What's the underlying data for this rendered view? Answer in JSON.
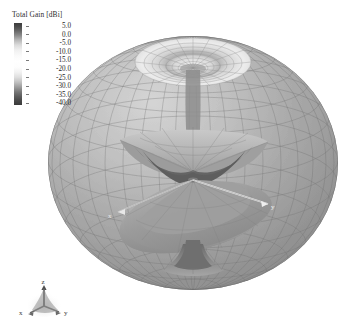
{
  "figure": {
    "kind": "3d-far-field-radiation-pattern",
    "background_color": "#ffffff",
    "render_style": "grayscale-shaded-mesh"
  },
  "legend": {
    "title": "Total Gain [dBi]",
    "orientation": "vertical",
    "colormap": "grayscale",
    "range_max": 5.0,
    "range_min": -40.0,
    "ticks": [
      {
        "label": "5.0"
      },
      {
        "label": "0.0"
      },
      {
        "label": "-5.0"
      },
      {
        "label": "-10.0"
      },
      {
        "label": "-15.0"
      },
      {
        "label": "-20.0"
      },
      {
        "label": "-25.0"
      },
      {
        "label": "-30.0"
      },
      {
        "label": "-35.0"
      },
      {
        "label": "-40.0"
      }
    ]
  },
  "plot": {
    "sphere": {
      "description": "wireframe-shaded bounding sphere",
      "center_x": 193,
      "center_y": 163,
      "radius_x": 145,
      "radius_y": 127
    },
    "axes_in_scene": [
      {
        "name": "y",
        "label": "y"
      },
      {
        "name": "x",
        "label": "x"
      }
    ]
  },
  "triad": {
    "z_label": "z",
    "x_label": "x",
    "y_label": "y"
  }
}
